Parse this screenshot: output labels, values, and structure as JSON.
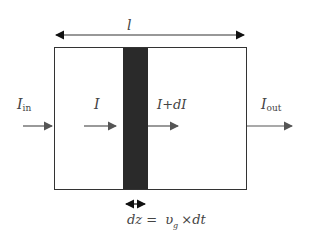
{
  "diagram": {
    "length_label": "l",
    "input_label": "I",
    "input_sub": "in",
    "current_label": "I",
    "increment_label": "I+dI",
    "output_label": "I",
    "output_sub": "out",
    "slice_eq_lhs": "dz =",
    "slice_eq_v": "υ",
    "slice_eq_vsub": "g",
    "slice_eq_rhs": "×dt",
    "colors": {
      "stroke": "#222222",
      "arrow": "#555555",
      "slice": "#2a2a2a"
    }
  }
}
